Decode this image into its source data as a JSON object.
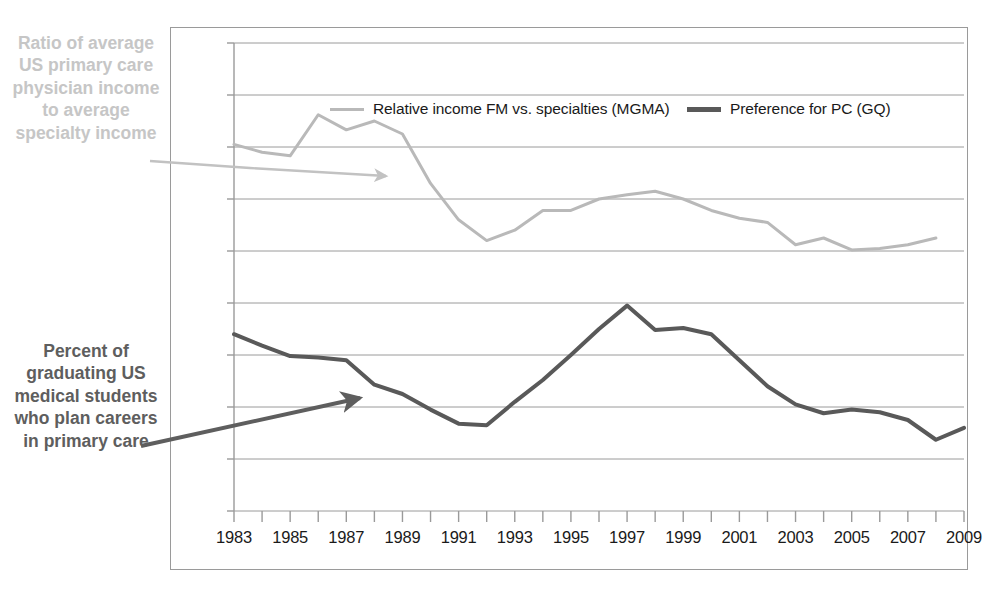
{
  "annotations": {
    "top_left": "Ratio of average US primary care physician income to average specialty income",
    "bottom_left": "Percent of graduating US medical students who plan careers in primary care"
  },
  "colors": {
    "series_income": "#b9b9b9",
    "series_preference": "#595959",
    "grid": "#9a9a9a",
    "frame": "#9a9a9a",
    "annotation_top": "#c6c6c6",
    "annotation_bottom": "#5e5e5e",
    "text": "#1a1a1a",
    "background": "#ffffff"
  },
  "chart_data": {
    "type": "line",
    "title": "",
    "xlabel": "",
    "ylabel": "",
    "xlim": [
      1983,
      2009
    ],
    "ylim": [
      0.0,
      0.9
    ],
    "ytick_labels": [
      "0.90",
      "0.80",
      "0.70",
      "0.60",
      "0.50",
      "0.40",
      "0.30",
      "0.20",
      "0.10",
      "0.00"
    ],
    "ytick_values": [
      0.9,
      0.8,
      0.7,
      0.6,
      0.5,
      0.4,
      0.3,
      0.2,
      0.1,
      0.0
    ],
    "xtick_labels": [
      "1983",
      "1985",
      "1987",
      "1989",
      "1991",
      "1993",
      "1995",
      "1997",
      "1999",
      "2001",
      "2003",
      "2005",
      "2007",
      "2009"
    ],
    "xtick_values": [
      1983,
      1985,
      1987,
      1989,
      1991,
      1993,
      1995,
      1997,
      1999,
      2001,
      2003,
      2005,
      2007,
      2009
    ],
    "minor_xticks": [
      1984,
      1986,
      1988,
      1990,
      1992,
      1994,
      1996,
      1998,
      2000,
      2002,
      2004,
      2006,
      2008
    ],
    "grid": "horizontal",
    "legend_position": "top-inside",
    "x": [
      1983,
      1984,
      1985,
      1986,
      1987,
      1988,
      1989,
      1990,
      1991,
      1992,
      1993,
      1994,
      1995,
      1996,
      1997,
      1998,
      1999,
      2000,
      2001,
      2002,
      2003,
      2004,
      2005,
      2006,
      2007,
      2008,
      2009
    ],
    "series": [
      {
        "name": "Relative income FM vs. specialties (MGMA)",
        "color": "#b9b9b9",
        "width": 3,
        "values": [
          0.705,
          0.69,
          0.683,
          0.762,
          0.733,
          0.75,
          0.725,
          0.63,
          0.56,
          0.52,
          0.54,
          0.578,
          0.578,
          0.6,
          0.608,
          0.615,
          0.6,
          0.578,
          0.563,
          0.555,
          0.512,
          0.525,
          0.502,
          0.505,
          0.512,
          0.525,
          null
        ]
      },
      {
        "name": "Preference for PC (GQ)",
        "color": "#595959",
        "width": 4,
        "values": [
          0.34,
          0.318,
          0.298,
          0.295,
          0.29,
          0.243,
          0.225,
          0.195,
          0.168,
          0.165,
          0.21,
          0.252,
          0.3,
          0.35,
          0.395,
          0.348,
          0.352,
          0.34,
          0.29,
          0.24,
          0.205,
          0.188,
          0.195,
          0.19,
          0.175,
          0.137,
          0.16
        ]
      }
    ]
  },
  "legend": [
    {
      "label": "Relative income FM vs. specialties (MGMA)",
      "color": "#b9b9b9",
      "thick": false
    },
    {
      "label": "Preference for PC (GQ)",
      "color": "#595959",
      "thick": true
    }
  ]
}
